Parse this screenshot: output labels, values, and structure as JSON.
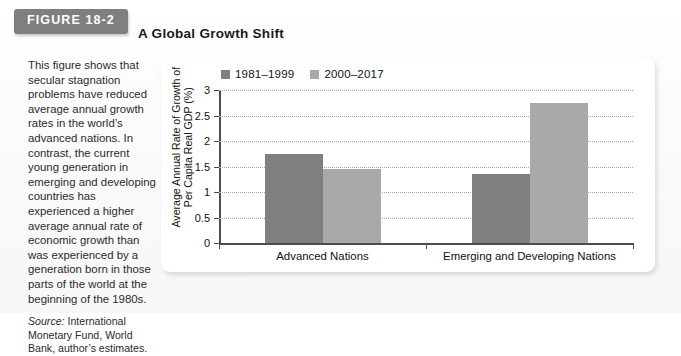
{
  "figure": {
    "badge_label": "FIGURE 18-2",
    "title": "A Global Growth Shift",
    "caption": "This figure shows that secular stagnation problems have reduced average annual growth rates in the world’s advanced nations. In contrast, the current young generation in emerging and developing countries has experienced a higher average annual rate of economic growth than was experienced by a generation born in those parts of the world at the beginning of the 1980s.",
    "source_label": "Source:",
    "source_text": " International Monetary Fund, World Bank, author’s estimates."
  },
  "colors": {
    "badge_bg": "#7f7f7f",
    "series_1": "#808080",
    "series_2": "#a9a9a9",
    "axis": "#4d4d4d",
    "grid": "#a9a9a9"
  },
  "chart_data": {
    "type": "bar",
    "title": "A Global Growth Shift",
    "xlabel": "",
    "ylabel": "Average Annual Rate of Growth of Per Capita Real GDP (%)",
    "ylabel_lines": [
      "Average Annual Rate of Growth of",
      "Per Capita Real GDP (%)"
    ],
    "categories": [
      "Advanced Nations",
      "Emerging and Developing Nations"
    ],
    "series": [
      {
        "name": "1981–1999",
        "values": [
          1.75,
          1.35
        ],
        "color": "#808080"
      },
      {
        "name": "2000–2017",
        "values": [
          1.45,
          2.75
        ],
        "color": "#a9a9a9"
      }
    ],
    "ylim": [
      0,
      3
    ],
    "yticks": [
      0,
      0.5,
      1,
      1.5,
      2,
      2.5,
      3
    ],
    "ytick_labels": [
      "0",
      "0.5",
      "1",
      "1.5",
      "2",
      "2.5",
      "3"
    ],
    "grid": true,
    "legend_position": "top-left"
  }
}
